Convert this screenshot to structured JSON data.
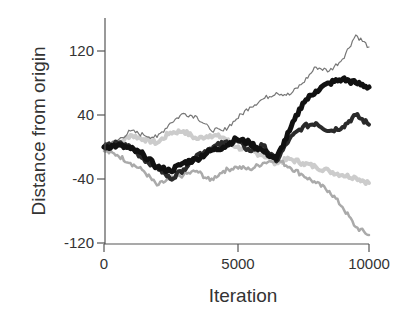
{
  "chart_data": {
    "type": "line",
    "title": "",
    "xlabel": "Iteration",
    "ylabel": "Distance from origin",
    "xlim": [
      0,
      10000
    ],
    "ylim": [
      -120,
      150
    ],
    "xticks": [
      0,
      5000,
      10000
    ],
    "xtick_labels": [
      "0",
      "5000",
      "10000"
    ],
    "yticks": [
      -120,
      -40,
      40,
      120
    ],
    "ytick_labels": [
      "-120",
      "-40",
      "40",
      "120"
    ],
    "grid": false,
    "legend": null,
    "x": [
      0,
      500,
      1000,
      1500,
      2000,
      2500,
      3000,
      3500,
      4000,
      4500,
      5000,
      5500,
      6000,
      6500,
      7000,
      7500,
      8000,
      8500,
      9000,
      9500,
      10000
    ],
    "series": [
      {
        "name": "walk-1",
        "color": "#777777",
        "width": 1.2,
        "values": [
          0,
          8,
          20,
          15,
          12,
          30,
          42,
          38,
          22,
          20,
          35,
          50,
          60,
          68,
          65,
          80,
          100,
          95,
          110,
          140,
          125
        ]
      },
      {
        "name": "walk-2",
        "color": "#111111",
        "width": 5,
        "values": [
          0,
          2,
          -2,
          -10,
          -25,
          -30,
          -20,
          -15,
          -5,
          0,
          10,
          5,
          -5,
          -15,
          20,
          55,
          70,
          80,
          85,
          80,
          75
        ]
      },
      {
        "name": "walk-3",
        "color": "#2a2a2a",
        "width": 4,
        "values": [
          0,
          5,
          0,
          -15,
          -25,
          -40,
          -28,
          -10,
          -2,
          5,
          8,
          -5,
          2,
          -18,
          10,
          25,
          30,
          20,
          25,
          40,
          28
        ]
      },
      {
        "name": "walk-4",
        "color": "#cccccc",
        "width": 4,
        "values": [
          0,
          3,
          15,
          10,
          5,
          18,
          20,
          10,
          15,
          12,
          0,
          -5,
          -10,
          -20,
          -15,
          -20,
          -25,
          -30,
          -35,
          -38,
          -45
        ]
      },
      {
        "name": "walk-5",
        "color": "#aaaaaa",
        "width": 2.5,
        "values": [
          -5,
          -10,
          -20,
          -30,
          -48,
          -40,
          -35,
          -30,
          -42,
          -30,
          -25,
          -28,
          -20,
          -15,
          -25,
          -35,
          -45,
          -55,
          -75,
          -100,
          -110
        ]
      }
    ]
  }
}
